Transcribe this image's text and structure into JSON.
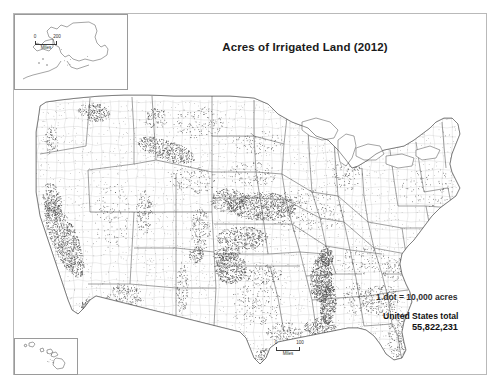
{
  "page": {
    "title": "Acres of Irrigated Land (2012)",
    "background_color": "#ffffff",
    "frame_color": "#b9b9b9",
    "dot_color": "#4a4a4a",
    "outline_color": "#3c3c3c",
    "county_color": "#b5b5b5"
  },
  "legend": {
    "dot_value_text": "1 dot = 10,000 acres",
    "total_label": "United States total",
    "total_value": "55,822,231"
  },
  "scalebars": {
    "main": {
      "min": "0",
      "max": "100",
      "unit": "Miles"
    },
    "alaska": {
      "min": "0",
      "max": "200",
      "unit": "Miles"
    },
    "hawaii": {
      "min": "0",
      "max": "100",
      "unit": "Miles"
    }
  },
  "insets": [
    {
      "name": "alaska",
      "label": "Alaska"
    },
    {
      "name": "hawaii",
      "label": "Hawaii"
    }
  ],
  "chart_data": {
    "type": "map",
    "map_kind": "dot-density",
    "title": "Acres of Irrigated Land (2012)",
    "units": "acres",
    "dot_value": 10000,
    "national_total": 55822231,
    "projection": "albers-usa",
    "regions": [
      {
        "name": "California Central Valley",
        "cx": 48,
        "cy": 150,
        "rx": 13,
        "ry": 42,
        "angle": -22,
        "dots": 900
      },
      {
        "name": "Imperial Valley",
        "cx": 72,
        "cy": 218,
        "rx": 7,
        "ry": 7,
        "angle": 0,
        "dots": 120
      },
      {
        "name": "Sacramento Valley",
        "cx": 36,
        "cy": 112,
        "rx": 9,
        "ry": 18,
        "angle": -10,
        "dots": 180
      },
      {
        "name": "Columbia Basin WA",
        "cx": 78,
        "cy": 24,
        "rx": 16,
        "ry": 9,
        "angle": 10,
        "dots": 200
      },
      {
        "name": "Snake River Plain ID",
        "cx": 150,
        "cy": 62,
        "rx": 30,
        "ry": 10,
        "angle": 18,
        "dots": 430
      },
      {
        "name": "Idaho North",
        "cx": 140,
        "cy": 30,
        "rx": 12,
        "ry": 10,
        "angle": 0,
        "dots": 90
      },
      {
        "name": "Oregon Willamette",
        "cx": 36,
        "cy": 52,
        "rx": 8,
        "ry": 14,
        "angle": 0,
        "dots": 70
      },
      {
        "name": "Montana valleys",
        "cx": 182,
        "cy": 34,
        "rx": 26,
        "ry": 16,
        "angle": 0,
        "dots": 110
      },
      {
        "name": "Utah Wasatch",
        "cx": 128,
        "cy": 124,
        "rx": 8,
        "ry": 22,
        "angle": 0,
        "dots": 130
      },
      {
        "name": "Colorado Front Range",
        "cx": 184,
        "cy": 142,
        "rx": 10,
        "ry": 22,
        "angle": 0,
        "dots": 150
      },
      {
        "name": "San Luis Valley CO",
        "cx": 180,
        "cy": 166,
        "rx": 7,
        "ry": 9,
        "angle": 0,
        "dots": 90
      },
      {
        "name": "Wyoming",
        "cx": 176,
        "cy": 92,
        "rx": 24,
        "ry": 14,
        "angle": 0,
        "dots": 110
      },
      {
        "name": "Nevada",
        "cx": 96,
        "cy": 128,
        "rx": 18,
        "ry": 34,
        "angle": 0,
        "dots": 90
      },
      {
        "name": "Arizona Phoenix/Yuma",
        "cx": 108,
        "cy": 208,
        "rx": 18,
        "ry": 12,
        "angle": 0,
        "dots": 150
      },
      {
        "name": "New Mexico Rio Grande",
        "cx": 166,
        "cy": 200,
        "rx": 6,
        "ry": 26,
        "angle": 0,
        "dots": 100
      },
      {
        "name": "Nebraska Platte",
        "cx": 246,
        "cy": 118,
        "rx": 34,
        "ry": 14,
        "angle": 0,
        "dots": 720
      },
      {
        "name": "Nebraska West",
        "cx": 212,
        "cy": 112,
        "rx": 18,
        "ry": 12,
        "angle": 0,
        "dots": 260
      },
      {
        "name": "Kansas High Plains",
        "cx": 226,
        "cy": 150,
        "rx": 26,
        "ry": 12,
        "angle": 0,
        "dots": 380
      },
      {
        "name": "Texas Panhandle",
        "cx": 214,
        "cy": 180,
        "rx": 16,
        "ry": 16,
        "angle": 0,
        "dots": 400
      },
      {
        "name": "Oklahoma Panhandle",
        "cx": 210,
        "cy": 166,
        "rx": 14,
        "ry": 7,
        "angle": 0,
        "dots": 120
      },
      {
        "name": "South Dakota",
        "cx": 236,
        "cy": 86,
        "rx": 24,
        "ry": 12,
        "angle": 0,
        "dots": 90
      },
      {
        "name": "North Dakota",
        "cx": 240,
        "cy": 54,
        "rx": 26,
        "ry": 12,
        "angle": 0,
        "dots": 70
      },
      {
        "name": "Missouri Bootheel",
        "cx": 310,
        "cy": 168,
        "rx": 7,
        "ry": 10,
        "angle": 0,
        "dots": 160
      },
      {
        "name": "Arkansas Delta",
        "cx": 305,
        "cy": 190,
        "rx": 11,
        "ry": 24,
        "angle": 5,
        "dots": 620
      },
      {
        "name": "Mississippi Delta",
        "cx": 312,
        "cy": 216,
        "rx": 8,
        "ry": 20,
        "angle": 5,
        "dots": 400
      },
      {
        "name": "Louisiana Rice",
        "cx": 304,
        "cy": 240,
        "rx": 16,
        "ry": 10,
        "angle": 0,
        "dots": 220
      },
      {
        "name": "Texas Gulf Coast",
        "cx": 268,
        "cy": 244,
        "rx": 18,
        "ry": 10,
        "angle": 0,
        "dots": 130
      },
      {
        "name": "Texas Rio Grande Valley",
        "cx": 248,
        "cy": 268,
        "rx": 9,
        "ry": 8,
        "angle": 0,
        "dots": 110
      },
      {
        "name": "Florida Peninsula",
        "cx": 384,
        "cy": 250,
        "rx": 13,
        "ry": 26,
        "angle": 0,
        "dots": 220
      },
      {
        "name": "Georgia Coastal Plain",
        "cx": 364,
        "cy": 212,
        "rx": 18,
        "ry": 16,
        "angle": 0,
        "dots": 200
      },
      {
        "name": "Carolinas",
        "cx": 386,
        "cy": 182,
        "rx": 20,
        "ry": 12,
        "angle": 0,
        "dots": 110
      },
      {
        "name": "Midwest Corn Belt",
        "cx": 290,
        "cy": 122,
        "rx": 40,
        "ry": 22,
        "angle": 0,
        "dots": 200
      },
      {
        "name": "Great Lakes Michigan",
        "cx": 330,
        "cy": 86,
        "rx": 16,
        "ry": 16,
        "angle": 0,
        "dots": 90
      },
      {
        "name": "Northeast",
        "cx": 412,
        "cy": 100,
        "rx": 26,
        "ry": 20,
        "angle": 0,
        "dots": 70
      },
      {
        "name": "Appalachia/Tennessee",
        "cx": 348,
        "cy": 172,
        "rx": 26,
        "ry": 14,
        "angle": 0,
        "dots": 90
      },
      {
        "name": "Alabama",
        "cx": 338,
        "cy": 210,
        "rx": 12,
        "ry": 16,
        "angle": 0,
        "dots": 80
      },
      {
        "name": "Oklahoma Central",
        "cx": 244,
        "cy": 186,
        "rx": 22,
        "ry": 10,
        "angle": 0,
        "dots": 120
      },
      {
        "name": "Texas Central",
        "cx": 240,
        "cy": 216,
        "rx": 26,
        "ry": 22,
        "angle": 0,
        "dots": 140
      }
    ],
    "inset_regions": [
      {
        "map": "alaska",
        "name": "Alaska",
        "cx": 60,
        "cy": 42,
        "rx": 14,
        "ry": 10,
        "dots": 6
      },
      {
        "map": "hawaii",
        "name": "Hawaii",
        "cx": 40,
        "cy": 18,
        "rx": 10,
        "ry": 6,
        "dots": 8
      }
    ]
  }
}
